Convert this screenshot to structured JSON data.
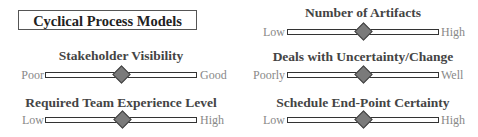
{
  "title": "Cyclical Process Models",
  "colors": {
    "track_border": "#333333",
    "thumb_fill": "#7a7a7a",
    "label": "#444444",
    "end_label": "#888888"
  },
  "sliders": [
    {
      "label": "Stakeholder Visibility",
      "min_label": "Poor",
      "max_label": "Good",
      "position_pct": 50
    },
    {
      "label": "Required Team Experience Level",
      "min_label": "Low",
      "max_label": "High",
      "position_pct": 50
    },
    {
      "label": "Number of Artifacts",
      "min_label": "Low",
      "max_label": "High",
      "position_pct": 50
    },
    {
      "label": "Deals with Uncertainty/Change",
      "min_label": "Poorly",
      "max_label": "Well",
      "position_pct": 50
    },
    {
      "label": "Schedule End-Point Certainty",
      "min_label": "Low",
      "max_label": "High",
      "position_pct": 50
    }
  ]
}
